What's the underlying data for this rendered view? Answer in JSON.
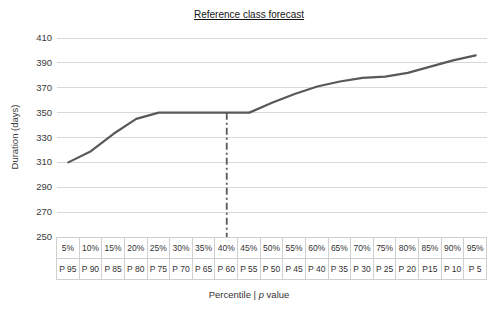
{
  "chart_data": {
    "type": "line",
    "title": "Reference class forecast",
    "ylabel": "Duration (days)",
    "xlabel_parts": {
      "prefix": "Percentile | ",
      "italic": "p",
      "suffix": " value"
    },
    "categories": [
      "5%",
      "10%",
      "15%",
      "20%",
      "25%",
      "30%",
      "35%",
      "40%",
      "45%",
      "50%",
      "55%",
      "60%",
      "65%",
      "70%",
      "75%",
      "80%",
      "85%",
      "90%",
      "95%"
    ],
    "p_value_labels": [
      "P 95",
      "P 90",
      "P 85",
      "P 80",
      "P 75",
      "P 70",
      "P 65",
      "P 60",
      "P 55",
      "P 50",
      "P 45",
      "P 40",
      "P 35",
      "P 30",
      "P 25",
      "P 20",
      "P15",
      "P 10",
      "P 5"
    ],
    "values": [
      310,
      319,
      333,
      345,
      350,
      350,
      350,
      350,
      350,
      358,
      365,
      371,
      375,
      378,
      379,
      382,
      387,
      392,
      396
    ],
    "ylim": [
      250,
      410
    ],
    "yticks": [
      410,
      390,
      370,
      350,
      330,
      310,
      290,
      270,
      250
    ],
    "grid": "horizontal",
    "legend": "none",
    "reference_line": {
      "category": "40%",
      "p_value": "P 60",
      "value": 350,
      "style": "dash-dot-vertical"
    },
    "colors": {
      "line": "#595959",
      "grid": "#d9d9d9",
      "text": "#3a3a3a",
      "title": "#141414",
      "table_border": "#d0d0d0"
    }
  }
}
